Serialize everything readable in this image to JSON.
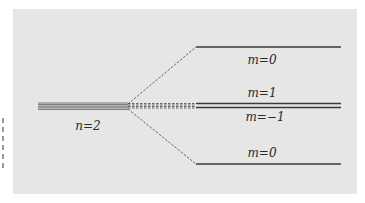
{
  "diagram": {
    "type": "energy-level-splitting",
    "unsplit_level": {
      "label": "n=2"
    },
    "split_levels": [
      {
        "label": "m=0",
        "position": "top"
      },
      {
        "label": "m=1",
        "position": "middle-upper"
      },
      {
        "label": "m=-1",
        "position": "middle-lower"
      },
      {
        "label": "m=0",
        "position": "bottom"
      }
    ],
    "colors": {
      "background": "#e6e6e6",
      "line": "#3a3a3a"
    }
  },
  "labels": {
    "n2": "n=2",
    "m0_top": "m=0",
    "m1": "m=1",
    "m_minus1": "m=−1",
    "m0_bottom": "m=0"
  }
}
